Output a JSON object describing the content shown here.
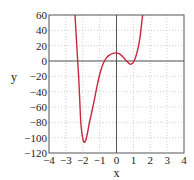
{
  "chart_data": {
    "type": "line",
    "title": "",
    "xlabel": "x",
    "ylabel": "y",
    "xlim": [
      -4,
      4
    ],
    "ylim": [
      -120,
      60
    ],
    "xticks": [
      -4,
      -3,
      -2,
      -1,
      0,
      1,
      2,
      3,
      4
    ],
    "yticks": [
      -120,
      -100,
      -80,
      -60,
      -40,
      -20,
      0,
      20,
      40,
      60
    ],
    "xtick_labels": [
      "−4",
      "−3",
      "−2",
      "−1",
      "0",
      "1",
      "2",
      "3",
      "4"
    ],
    "ytick_labels": [
      "−120",
      "−100",
      "−80",
      "−60",
      "−40",
      "−20",
      "0",
      "20",
      "40",
      "60"
    ],
    "grid": true,
    "legend": null,
    "series": [
      {
        "name": "y",
        "color": "#c8283c",
        "x": [
          -2.46,
          -2.38,
          -2.3,
          -2.24,
          -2.18,
          -2.12,
          -2.05,
          -1.98,
          -1.92,
          -1.86,
          -1.8,
          -1.72,
          -1.62,
          -1.5,
          -1.37,
          -1.2,
          -1.0,
          -0.8,
          -0.6,
          -0.4,
          -0.2,
          0.0,
          0.2,
          0.4,
          0.6,
          0.8,
          0.95,
          1.1,
          1.2,
          1.3,
          1.4,
          1.49,
          1.55
        ],
        "y": [
          60,
          30,
          0,
          -22,
          -50,
          -79,
          -94,
          -103,
          -106,
          -105,
          -102,
          -94,
          -82,
          -70,
          -57,
          -38,
          -18,
          -4,
          4,
          8,
          10,
          10.5,
          9,
          5,
          0,
          -4,
          -3,
          3,
          10,
          19,
          32,
          49,
          60
        ]
      }
    ],
    "colors": {
      "curve": "#c8283c",
      "axes_frame": "#555555",
      "grid": "#b0b0b0",
      "zero_lines": "#555555"
    }
  }
}
